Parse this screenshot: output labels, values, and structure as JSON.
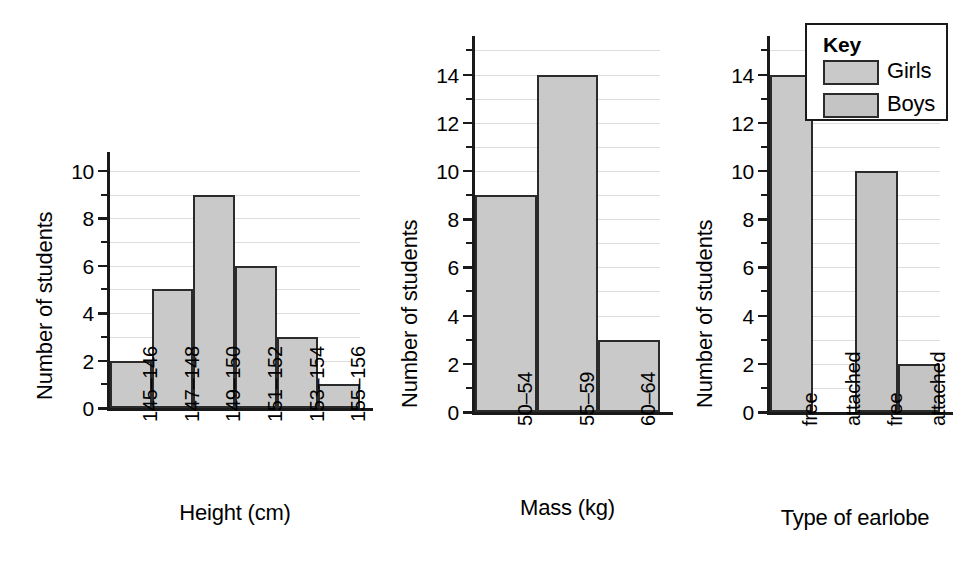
{
  "figure": {
    "background": "#ffffff",
    "bar_fill_girls": "#c9c9c9",
    "bar_fill_boys": "#c4c4c4",
    "bar_stroke": "#2b2b2b",
    "grid_color": "#dddddd",
    "axis_color": "#1a1a1a"
  },
  "charts": [
    {
      "id": "height-histogram",
      "ylabel": "Number of students",
      "xlabel": "Height (cm)",
      "yticks": [
        "0",
        "2",
        "4",
        "6",
        "8",
        "10"
      ],
      "categories": [
        "145–146",
        "147–148",
        "149–150",
        "151–152",
        "153–154",
        "155–156"
      ],
      "values": [
        2,
        5,
        9,
        6,
        3,
        1
      ]
    },
    {
      "id": "mass-histogram",
      "ylabel": "Number of students",
      "xlabel": "Mass (kg)",
      "yticks": [
        "0",
        "2",
        "4",
        "6",
        "8",
        "10",
        "12",
        "14"
      ],
      "categories": [
        "50–54",
        "55–59",
        "60–64"
      ],
      "values": [
        9,
        14,
        3
      ]
    },
    {
      "id": "earlobe-barchart",
      "ylabel": "Number of students",
      "xlabel": "Type of earlobe",
      "yticks": [
        "0",
        "2",
        "4",
        "6",
        "8",
        "10",
        "12",
        "14"
      ],
      "categories": [
        "free",
        "attached",
        "free",
        "attached"
      ],
      "values": [
        14,
        0,
        10,
        2
      ],
      "groups": [
        "Girls",
        "Girls",
        "Boys",
        "Boys"
      ]
    }
  ],
  "legend": {
    "title": "Key",
    "entries": [
      {
        "label": "Girls",
        "color": "#c9c9c9"
      },
      {
        "label": "Boys",
        "color": "#c4c4c4"
      }
    ]
  },
  "chart_data": [
    {
      "type": "bar",
      "title": "",
      "xlabel": "Height (cm)",
      "ylabel": "Number of students",
      "categories": [
        "145–146",
        "147–148",
        "149–150",
        "151–152",
        "153–154",
        "155–156"
      ],
      "values": [
        2,
        5,
        9,
        6,
        3,
        1
      ],
      "ylim": [
        0,
        10.8
      ],
      "ytick_values": [
        0,
        2,
        4,
        6,
        8,
        10
      ],
      "minor_ytick_values": [
        1,
        3,
        5,
        7,
        9
      ],
      "grid": true,
      "legend": "none",
      "notes": "Histogram, adjacent touching bars, x tick labels rotated 90 degrees"
    },
    {
      "type": "bar",
      "title": "",
      "xlabel": "Mass (kg)",
      "ylabel": "Number of students",
      "categories": [
        "50–54",
        "55–59",
        "60–64"
      ],
      "values": [
        9,
        14,
        3
      ],
      "ylim": [
        0,
        15.6
      ],
      "ytick_values": [
        0,
        2,
        4,
        6,
        8,
        10,
        12,
        14
      ],
      "minor_ytick_values": [
        1,
        3,
        5,
        7,
        9,
        11,
        13,
        15
      ],
      "grid": true,
      "legend": "none",
      "notes": "Histogram, adjacent touching bars, x tick labels rotated 90 degrees"
    },
    {
      "type": "bar",
      "title": "",
      "xlabel": "Type of earlobe",
      "ylabel": "Number of students",
      "categories": [
        "free",
        "attached",
        "free",
        "attached"
      ],
      "values": [
        14,
        0,
        10,
        2
      ],
      "series": [
        {
          "name": "Girls",
          "categories": [
            "free",
            "attached"
          ],
          "values": [
            14,
            0
          ]
        },
        {
          "name": "Boys",
          "categories": [
            "free",
            "attached"
          ],
          "values": [
            10,
            2
          ]
        }
      ],
      "ylim": [
        0,
        15.6
      ],
      "ytick_values": [
        0,
        2,
        4,
        6,
        8,
        10,
        12,
        14
      ],
      "minor_ytick_values": [
        1,
        3,
        5,
        7,
        9,
        11,
        13,
        15
      ],
      "grid": true,
      "legend": "top-right",
      "legend_title": "Key",
      "legend_entries": [
        "Girls",
        "Boys"
      ],
      "notes": "Grouped bar chart; attached-earlobe girls bar has value 0 so no bar is drawn"
    }
  ]
}
